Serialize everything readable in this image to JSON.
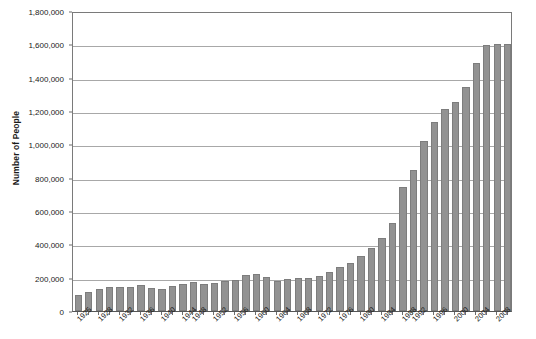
{
  "chart_data": {
    "type": "bar",
    "title": "",
    "xlabel": "",
    "ylabel": "Number of People",
    "ylim": [
      0,
      1800000
    ],
    "ytick_values": [
      0,
      200000,
      400000,
      600000,
      800000,
      1000000,
      1200000,
      1400000,
      1600000,
      1800000
    ],
    "ytick_labels": [
      "0",
      "200,000",
      "400,000",
      "600,000",
      "800,000",
      "1,000,000",
      "1,200,000",
      "1,400,000",
      "1,600,000",
      "1,800,000"
    ],
    "grid": true,
    "legend": false,
    "bar_color": "#929292",
    "bar_border_color": "#7d7d7d",
    "categories": [
      "1925",
      "1926",
      "1927",
      "1928",
      "1929",
      "1930",
      "1931",
      "1932",
      "1933",
      "1934",
      "1935",
      "1936",
      "1937",
      "1938",
      "1939",
      "1940",
      "1941",
      "1942",
      "1943",
      "1944",
      "1945",
      "1946",
      "1947",
      "1948",
      "1949",
      "1950",
      "1951",
      "1952",
      "1953",
      "1954",
      "1955",
      "1956",
      "1957",
      "1958",
      "1959",
      "1960",
      "1961",
      "1962",
      "1963",
      "1964",
      "1965",
      "1966"
    ],
    "values": [
      95000,
      115000,
      130000,
      145000,
      147000,
      145000,
      155000,
      140000,
      130000,
      150000,
      160000,
      175000,
      165000,
      170000,
      180000,
      185000,
      215000,
      222000,
      205000,
      180000,
      190000,
      200000,
      200000,
      210000,
      235000,
      265000,
      290000,
      330000,
      380000,
      440000,
      530000,
      745000,
      845000,
      1020000,
      1135000,
      1215000,
      1255000,
      1345000,
      1490000,
      1595000,
      1605000,
      1600000
    ],
    "x_label_positions": [
      0,
      3,
      7,
      11,
      15,
      19,
      23,
      27,
      31,
      35,
      39,
      41
    ],
    "x_labels_shown": [
      "1925",
      "1928",
      "1932",
      "1936",
      "1940",
      "1944",
      "1948",
      "1952",
      "1956",
      "1960",
      "1964",
      "1968",
      "1972",
      "1976",
      "1980",
      "1984",
      "1988",
      "1992",
      "1996",
      "2000",
      "2004",
      "2008"
    ],
    "x_tick_label_interval": 4,
    "x_first_label": "1925",
    "x_last_label": "2008"
  }
}
